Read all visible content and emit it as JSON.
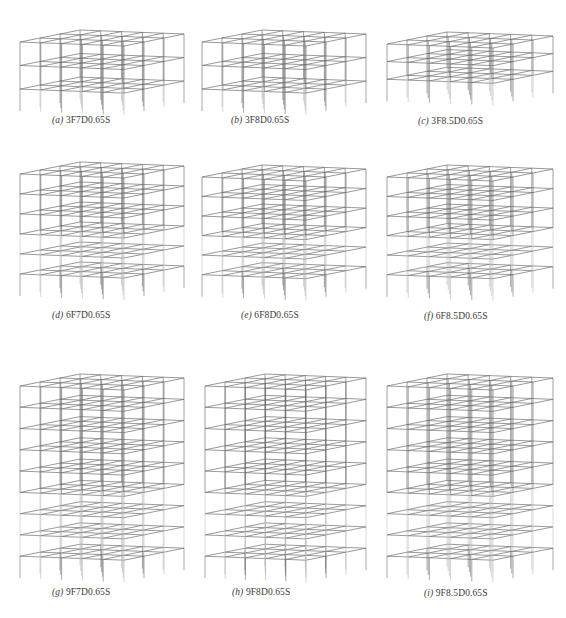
{
  "figure": {
    "stroke_color": "#6e6e6e",
    "stroke_light": "#b5b5b5",
    "panels": [
      {
        "id": "a",
        "letter": "(a)",
        "label": "3F7D0.65S",
        "stories": 3,
        "x": 18,
        "y": 28,
        "w": 168,
        "h": 80,
        "cap_x": 52,
        "cap_y": 123
      },
      {
        "id": "b",
        "letter": "(b)",
        "label": "3F8D0.65S",
        "stories": 3,
        "x": 200,
        "y": 28,
        "w": 168,
        "h": 80,
        "cap_x": 231,
        "cap_y": 123
      },
      {
        "id": "c",
        "letter": "(c)",
        "label": "3F8.5D0.65S",
        "stories": 3,
        "x": 385,
        "y": 30,
        "w": 170,
        "h": 60,
        "cap_x": 418,
        "cap_y": 124
      },
      {
        "id": "d",
        "letter": "(d)",
        "label": "6F7D0.65S",
        "stories": 6,
        "x": 18,
        "y": 160,
        "w": 168,
        "h": 128,
        "cap_x": 52,
        "cap_y": 318
      },
      {
        "id": "e",
        "letter": "(e)",
        "label": "6F8D0.65S",
        "stories": 6,
        "x": 200,
        "y": 163,
        "w": 168,
        "h": 125,
        "cap_x": 241,
        "cap_y": 318
      },
      {
        "id": "f",
        "letter": "(f)",
        "label": "6F8.5D0.65S",
        "stories": 6,
        "x": 385,
        "y": 163,
        "w": 170,
        "h": 125,
        "cap_x": 424,
        "cap_y": 319
      },
      {
        "id": "g",
        "letter": "(g)",
        "label": "9F7D0.65S",
        "stories": 9,
        "x": 18,
        "y": 372,
        "w": 168,
        "h": 200,
        "cap_x": 52,
        "cap_y": 595
      },
      {
        "id": "h",
        "letter": "(h)",
        "label": "9F8D0.65S",
        "stories": 9,
        "x": 203,
        "y": 372,
        "w": 165,
        "h": 200,
        "cap_x": 232,
        "cap_y": 595
      },
      {
        "id": "i",
        "letter": "(i)",
        "label": "9F8.5D0.65S",
        "stories": 9,
        "x": 385,
        "y": 372,
        "w": 170,
        "h": 200,
        "cap_x": 424,
        "cap_y": 596
      }
    ]
  }
}
